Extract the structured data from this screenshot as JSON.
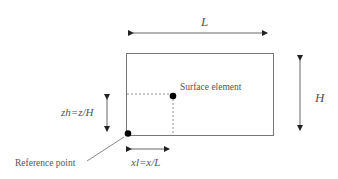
{
  "diagram": {
    "labels": {
      "length": "L",
      "height": "H",
      "zh": "zh=z/H",
      "xl": "xl=x/L",
      "surface_element": "Surface element",
      "reference_point": "Reference point"
    },
    "colors": {
      "line": "#555555",
      "dot": "#000000",
      "background": "#ffffff"
    },
    "geometry": {
      "rect": {
        "x": 126,
        "y": 53,
        "w": 147,
        "h": 83
      },
      "surface_element_point": {
        "x": 173,
        "y": 96
      },
      "reference_point": {
        "x": 128,
        "y": 133
      }
    }
  }
}
